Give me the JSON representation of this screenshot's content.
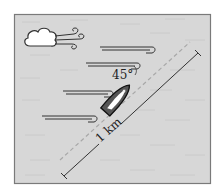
{
  "diagram": {
    "type": "physics-illustration",
    "angle_label": "45°",
    "scale_label": "1 km",
    "elements": {
      "cloud": "cloud-with-wind",
      "boat": "sailboat-top-view",
      "wind_lines": 4,
      "heading_line": "dashed",
      "scale_line": "solid"
    },
    "colors": {
      "background": "#d7d7d7",
      "border": "#7a7a7a",
      "line": "#333333",
      "dashed": "#a8a8a8",
      "boat_hull": "#555555"
    }
  }
}
